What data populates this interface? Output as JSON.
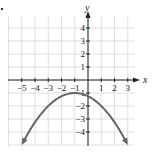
{
  "chart_data": {
    "type": "line",
    "title": "",
    "xlabel": "x",
    "ylabel": "y",
    "xlim": [
      -5.6,
      3.6
    ],
    "ylim": [
      -5.0,
      4.8
    ],
    "grid": true,
    "x_ticks": [
      -5,
      -4,
      -3,
      -2,
      -1,
      1,
      2,
      3
    ],
    "x_tick_labels": [
      "−5",
      "−4",
      "−3",
      "−2",
      "−1",
      "1",
      "2",
      "3"
    ],
    "y_ticks": [
      4,
      3,
      2,
      1,
      -1,
      -2,
      -3,
      -4
    ],
    "y_tick_labels": [
      "4",
      "3",
      "2",
      "1",
      "−1",
      "−2",
      "−3",
      "−4"
    ],
    "series": [
      {
        "name": "parabola",
        "equation": "y = -(x+1)^2/4 - 1",
        "vertex": [
          -1,
          -1
        ],
        "x": [
          -4.9,
          -4,
          -3,
          -2,
          -1,
          0,
          1,
          2,
          2.9
        ],
        "y": [
          -4.8,
          -3.25,
          -2,
          -1.25,
          -1,
          -1.25,
          -2,
          -3.25,
          -4.8
        ],
        "arrows_at_ends": true,
        "color": "#666666"
      }
    ],
    "colors": {
      "grid": "#d8d8d8",
      "axis": "#222222",
      "curve": "#666666",
      "text": "#222222"
    }
  }
}
